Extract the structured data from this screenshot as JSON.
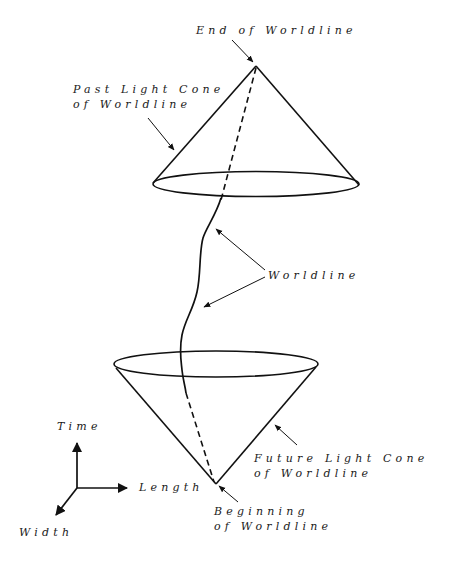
{
  "diagram": {
    "labels": {
      "end": "End of Worldline",
      "past_cone_line1": "Past Light Cone",
      "past_cone_line2": "of Worldline",
      "worldline": "Worldline",
      "future_cone_line1": "Future Light Cone",
      "future_cone_line2": "of Worldline",
      "beginning_line1": "Beginning",
      "beginning_line2": "of Worldline",
      "axis_time": "Time",
      "axis_length": "Length",
      "axis_width": "Width"
    },
    "colors": {
      "stroke": "#111111",
      "background": "#ffffff"
    },
    "elements": [
      "past-light-cone (apex at end of worldline)",
      "future-light-cone (apex at beginning of worldline)",
      "worldline curve",
      "dashed hidden worldline segments inside cones",
      "axis triad: Time (up), Length (right), Width (down-left)"
    ]
  }
}
